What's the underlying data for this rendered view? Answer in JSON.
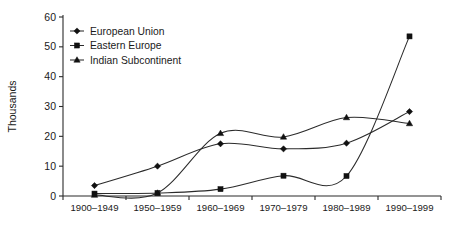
{
  "chart_data": {
    "type": "line",
    "title": "",
    "xlabel": "",
    "ylabel": "Thousands",
    "ylim": [
      0,
      60
    ],
    "yticks": [
      0,
      10,
      20,
      30,
      40,
      50,
      60
    ],
    "grid": false,
    "legend_position": "top-left-inside",
    "categories": [
      "1900–1949",
      "1950–1959",
      "1960–1969",
      "1970–1979",
      "1980–1989",
      "1990–1999"
    ],
    "series": [
      {
        "name": "European Union",
        "marker": "diamond",
        "values": [
          3.5,
          10.0,
          17.5,
          15.8,
          17.7,
          28.3
        ]
      },
      {
        "name": "Eastern Europe",
        "marker": "square",
        "values": [
          0.8,
          1.0,
          2.3,
          6.8,
          6.7,
          53.5
        ]
      },
      {
        "name": "Indian Subcontinent",
        "marker": "triangle",
        "values": [
          0.3,
          1.0,
          21.0,
          19.8,
          26.3,
          24.3
        ]
      }
    ]
  },
  "axis": {
    "y_title": "Thousands",
    "y_tick_labels": [
      "0",
      "10",
      "20",
      "30",
      "40",
      "50",
      "60"
    ],
    "x_tick_labels": [
      "1900–1949",
      "1950–1959",
      "1960–1969",
      "1970–1979",
      "1980–1989",
      "1990–1999"
    ]
  },
  "legend": {
    "items": [
      {
        "label": "European Union",
        "marker": "diamond-marker"
      },
      {
        "label": "Eastern Europe",
        "marker": "square-marker"
      },
      {
        "label": "Indian Subcontinent",
        "marker": "triangle-marker"
      }
    ]
  },
  "colors": {
    "ink": "#2b2b2b",
    "marker": "#111111",
    "background": "#ffffff"
  }
}
